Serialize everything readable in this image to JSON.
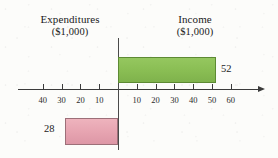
{
  "chart_data": {
    "type": "bar",
    "orientation": "horizontal",
    "title": "",
    "categories": [
      "Expenditures",
      "Income"
    ],
    "values": [
      28,
      52
    ],
    "series": [
      {
        "name": "Expenditures ($1,000)",
        "value": 28,
        "direction": "left",
        "color": "#e6a3b0",
        "border_color": "#9c6f78"
      },
      {
        "name": "Income ($1,000)",
        "value": 52,
        "direction": "right",
        "color": "#89bd53",
        "border_color": "#5d8a33"
      }
    ],
    "xlabel": "",
    "ylabel": "",
    "xlim": [
      -45,
      65
    ],
    "axis_ticks_left": [
      40,
      30,
      20,
      10
    ],
    "axis_ticks_right": [
      10,
      20,
      30,
      40,
      50,
      60
    ],
    "tick_interval": 10,
    "unit": "$1,000",
    "grid": false,
    "legend": false,
    "axis_arrow": "right"
  },
  "labels": {
    "expenditures_title": "Expenditures",
    "expenditures_unit": "($1,000)",
    "income_title": "Income",
    "income_unit": "($1,000)",
    "expenditures_value": "28",
    "income_value": "52"
  },
  "ticks": {
    "left": [
      "40",
      "30",
      "20",
      "10"
    ],
    "right": [
      "10",
      "20",
      "30",
      "40",
      "50",
      "60"
    ]
  },
  "colors": {
    "income_fill": "#89bd53",
    "income_border": "#5d8a33",
    "expenditures_fill": "#e6a3b0",
    "expenditures_border": "#9c6f78",
    "axis": "#3b3b3b",
    "paper": "#fcfcfa"
  }
}
